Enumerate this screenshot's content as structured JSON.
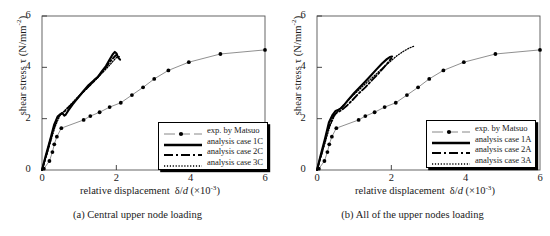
{
  "figure": {
    "panels": [
      {
        "id": "a",
        "caption": "(a) Central upper node loading",
        "legend": {
          "entries": [
            {
              "label": "exp. by Matsuo",
              "style": "line-marker"
            },
            {
              "label": "analysis case 1C",
              "style": "solid-thick"
            },
            {
              "label": "analysis case 2C",
              "style": "dashdot"
            },
            {
              "label": "analysis case 3C",
              "style": "dotted"
            }
          ]
        }
      },
      {
        "id": "b",
        "caption": "(b) All of the upper nodes loading",
        "legend": {
          "entries": [
            {
              "label": "exp. by Matsuo",
              "style": "line-marker"
            },
            {
              "label": "analysis case 1A",
              "style": "solid-thick"
            },
            {
              "label": "analysis case 2A",
              "style": "dashdot"
            },
            {
              "label": "analysis case 3A",
              "style": "dotted"
            }
          ]
        }
      }
    ]
  },
  "chart_data": [
    {
      "type": "line",
      "title": "(a) Central upper node loading",
      "xlabel": "relative displacement  δ/d (×10⁻³)",
      "ylabel": "shear stress τ (N/mm⁻²)",
      "xlim": [
        0,
        6
      ],
      "ylim": [
        0,
        6
      ],
      "xticks": [
        0,
        2,
        4,
        6
      ],
      "yticks": [
        0,
        2,
        4,
        6
      ],
      "grid": false,
      "legend_position": "lower-right",
      "series": [
        {
          "name": "exp. by Matsuo",
          "style": "line-marker",
          "marker": "filled-circle",
          "x": [
            0.05,
            0.2,
            0.28,
            0.33,
            0.4,
            0.52,
            1.12,
            1.3,
            1.55,
            1.82,
            2.12,
            2.42,
            2.72,
            3.02,
            3.4,
            3.95,
            4.8,
            6.0
          ],
          "y": [
            0.05,
            0.35,
            0.7,
            1.0,
            1.3,
            1.63,
            1.95,
            2.1,
            2.25,
            2.45,
            2.62,
            2.92,
            3.22,
            3.55,
            3.88,
            4.2,
            4.52,
            4.68,
            3.7
          ]
        },
        {
          "name": "analysis case 1C",
          "style": "solid-thick",
          "x": [
            0.0,
            0.1,
            0.22,
            0.33,
            0.42,
            0.5,
            0.56,
            0.6,
            0.64,
            0.7,
            0.82,
            0.95,
            1.1,
            1.25,
            1.4,
            1.5,
            1.6,
            1.72,
            1.82,
            1.9,
            1.96,
            2.0,
            2.05,
            2.1
          ],
          "y": [
            0.0,
            0.55,
            1.18,
            1.78,
            2.08,
            2.18,
            2.2,
            2.12,
            2.16,
            2.3,
            2.55,
            2.78,
            3.05,
            3.3,
            3.5,
            3.62,
            3.82,
            4.05,
            4.3,
            4.5,
            4.6,
            4.55,
            4.38,
            4.3
          ]
        },
        {
          "name": "analysis case 2C",
          "style": "dashdot",
          "x": [
            0.0,
            0.15,
            0.3,
            0.42,
            0.52,
            0.62,
            0.75,
            0.9,
            1.08,
            1.25,
            1.42,
            1.58,
            1.72,
            1.85,
            1.95,
            2.02
          ],
          "y": [
            0.0,
            0.75,
            1.55,
            2.05,
            2.2,
            2.3,
            2.5,
            2.72,
            3.0,
            3.25,
            3.5,
            3.75,
            4.0,
            4.25,
            4.42,
            4.5
          ]
        },
        {
          "name": "analysis case 3C",
          "style": "dotted",
          "x": [
            0.0,
            0.18,
            0.35,
            0.48,
            0.6,
            0.75,
            0.92,
            1.1,
            1.28,
            1.45,
            1.62,
            1.78,
            1.9,
            2.0,
            2.08
          ],
          "y": [
            0.0,
            0.85,
            1.68,
            2.12,
            2.3,
            2.52,
            2.78,
            3.02,
            3.28,
            3.52,
            3.78,
            4.02,
            4.22,
            4.38,
            4.42
          ]
        }
      ]
    },
    {
      "type": "line",
      "title": "(b) All of the upper nodes loading",
      "xlabel": "relative displacement  δ/d (×10⁻³)",
      "ylabel": "shear stress τ (N/mm⁻²)",
      "xlim": [
        0,
        6
      ],
      "ylim": [
        0,
        6
      ],
      "xticks": [
        0,
        2,
        4,
        6
      ],
      "yticks": [
        0,
        2,
        4,
        6
      ],
      "grid": false,
      "legend_position": "lower-right",
      "series": [
        {
          "name": "exp. by Matsuo",
          "style": "line-marker",
          "marker": "filled-circle",
          "x": [
            0.05,
            0.2,
            0.28,
            0.33,
            0.4,
            0.52,
            1.12,
            1.3,
            1.55,
            1.82,
            2.12,
            2.42,
            2.72,
            3.02,
            3.4,
            3.95,
            4.8,
            6.0
          ],
          "y": [
            0.05,
            0.35,
            0.7,
            1.0,
            1.3,
            1.63,
            1.95,
            2.1,
            2.25,
            2.45,
            2.62,
            2.92,
            3.22,
            3.55,
            3.88,
            4.2,
            4.52,
            4.68,
            3.7
          ]
        },
        {
          "name": "analysis case 1A",
          "style": "solid-thick",
          "x": [
            0.0,
            0.1,
            0.22,
            0.32,
            0.42,
            0.5,
            0.58,
            0.64,
            0.72,
            0.85,
            1.0,
            1.15,
            1.3,
            1.45,
            1.6,
            1.75,
            1.88,
            1.96,
            2.02
          ],
          "y": [
            0.0,
            0.58,
            1.25,
            1.85,
            2.15,
            2.3,
            2.35,
            2.4,
            2.52,
            2.75,
            3.0,
            3.22,
            3.45,
            3.68,
            3.92,
            4.15,
            4.32,
            4.4,
            4.42
          ]
        },
        {
          "name": "analysis case 2A",
          "style": "dashdot",
          "x": [
            0.0,
            0.15,
            0.3,
            0.45,
            0.55,
            0.65,
            0.8,
            0.95,
            1.12,
            1.3,
            1.48,
            1.65,
            1.8,
            1.92,
            2.0
          ],
          "y": [
            0.0,
            0.78,
            1.6,
            2.12,
            2.25,
            2.32,
            2.5,
            2.72,
            2.98,
            3.22,
            3.5,
            3.75,
            4.0,
            4.2,
            4.35
          ]
        },
        {
          "name": "analysis case 3A",
          "style": "dotted",
          "x": [
            0.0,
            0.18,
            0.35,
            0.5,
            0.62,
            0.78,
            0.95,
            1.15,
            1.35,
            1.55,
            1.75,
            1.95,
            2.15,
            2.32,
            2.48,
            2.6
          ],
          "y": [
            0.0,
            0.88,
            1.72,
            2.2,
            2.4,
            2.62,
            2.88,
            3.15,
            3.42,
            3.68,
            3.95,
            4.2,
            4.45,
            4.62,
            4.75,
            4.82
          ]
        }
      ]
    }
  ]
}
